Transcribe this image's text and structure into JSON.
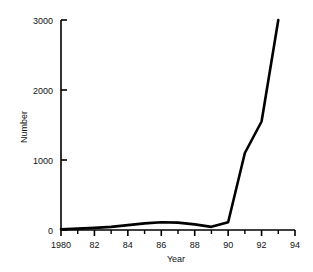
{
  "chart_data": {
    "type": "line",
    "title": "",
    "xlabel": "Year",
    "ylabel": "Number",
    "xlim": [
      1980,
      1994
    ],
    "ylim": [
      0,
      3000
    ],
    "grid": false,
    "legend": null,
    "x_ticks_major": [
      1980,
      1982,
      1984,
      1986,
      1988,
      1990,
      1992,
      1994
    ],
    "x_tick_labels": [
      "1980",
      "82",
      "84",
      "86",
      "88",
      "90",
      "92",
      "94"
    ],
    "x_ticks_minor": [
      1981,
      1983,
      1985,
      1987,
      1989,
      1991,
      1993
    ],
    "y_ticks": [
      0,
      1000,
      2000,
      3000
    ],
    "y_tick_labels": [
      "0",
      "1000",
      "2000",
      "3000"
    ],
    "x": [
      1980,
      1981,
      1982,
      1983,
      1984,
      1985,
      1986,
      1987,
      1988,
      1989,
      1990,
      1991,
      1992,
      1993
    ],
    "values": [
      10,
      20,
      30,
      45,
      70,
      95,
      110,
      105,
      80,
      45,
      110,
      1100,
      1550,
      3000
    ],
    "series": [
      {
        "name": "Number",
        "color": "#000000",
        "line_width": 2.6,
        "values": [
          10,
          20,
          30,
          45,
          70,
          95,
          110,
          105,
          80,
          45,
          110,
          1100,
          1550,
          3000
        ]
      }
    ]
  },
  "axes": {
    "line_color": "#000000",
    "background": "#ffffff"
  }
}
